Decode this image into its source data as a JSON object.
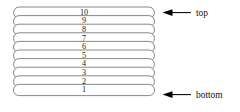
{
  "figure": {
    "name": "stack-of-plates-diagram",
    "background_color": "#ffffff",
    "outline_color": "#7b7b7b",
    "arrow_color": "#000000",
    "text_color": "#111111"
  },
  "stack": {
    "orientation": "vertical",
    "shape": "stadium",
    "count": 10,
    "plates": [
      {
        "label": "10",
        "position": "top"
      },
      {
        "label": "9",
        "position": "middle"
      },
      {
        "label": "8",
        "position": "middle"
      },
      {
        "label": "7",
        "position": "middle"
      },
      {
        "label": "6",
        "position": "middle"
      },
      {
        "label": "5",
        "position": "middle"
      },
      {
        "label": "4",
        "position": "middle"
      },
      {
        "label": "3",
        "position": "middle"
      },
      {
        "label": "2",
        "position": "middle"
      },
      {
        "label": "1",
        "position": "bottom"
      }
    ]
  },
  "annotations": {
    "top": {
      "label": "top",
      "arrow": "left-arrow",
      "points_to": "10"
    },
    "bottom": {
      "label": "bottom",
      "arrow": "left-arrow",
      "points_to": "1"
    }
  }
}
